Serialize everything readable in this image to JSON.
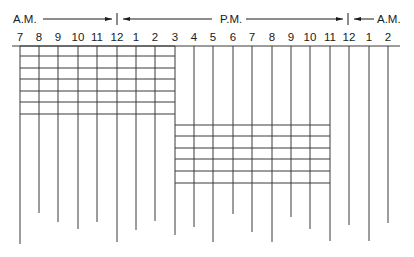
{
  "header": {
    "segments": [
      {
        "label": "A.M.",
        "period": "am-start"
      },
      {
        "label": "P.M.",
        "period": "pm"
      },
      {
        "label": "A.M.",
        "period": "am-end"
      }
    ]
  },
  "hours": [
    "7",
    "8",
    "9",
    "10",
    "11",
    "12",
    "1",
    "2",
    "3",
    "4",
    "5",
    "6",
    "7",
    "8",
    "9",
    "10",
    "11",
    "12",
    "1",
    "2"
  ],
  "colors": {
    "line": "#3a3a3a",
    "text": "#1a1a1a",
    "background": "#ffffff"
  },
  "layout": {
    "hour_x": [
      20,
      39,
      58,
      78,
      97,
      117,
      136,
      155,
      175,
      194,
      213,
      233,
      252,
      272,
      291,
      310,
      330,
      349,
      369,
      388
    ],
    "line_bottoms": [
      244,
      213,
      222,
      229,
      222,
      242,
      230,
      221,
      235,
      227,
      242,
      214,
      232,
      242,
      217,
      229,
      241,
      225,
      241,
      223
    ],
    "baseline_y": 46,
    "top_grid": {
      "from_index": 0,
      "to_index": 8,
      "rows_y": [
        46,
        56,
        68,
        79,
        91,
        102,
        114
      ]
    },
    "bottom_grid": {
      "from_index": 8,
      "to_index": 16,
      "rows_y": [
        125,
        136,
        148,
        159,
        171,
        183
      ]
    }
  }
}
